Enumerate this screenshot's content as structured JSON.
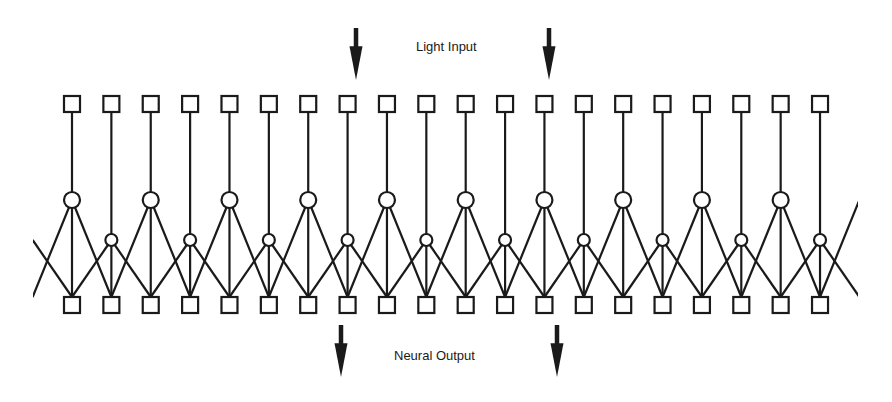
{
  "diagram": {
    "title_input": "Light Input",
    "title_output": "Neural Output",
    "colors": {
      "background": "#ffffff",
      "stroke": "#1a1a1a",
      "fill": "#ffffff"
    },
    "layout": {
      "columns": 20,
      "x_start": 72,
      "x_spacing": 39.37,
      "top_square_y": 96,
      "bottom_square_y": 297,
      "square_size": 16,
      "large_circle_y": 200,
      "large_circle_r": 8,
      "small_circle_y": 240,
      "small_circle_r": 6,
      "stroke_width": 2.2,
      "edge_clip_left": 33,
      "edge_clip_right": 858
    },
    "nodes": {
      "receptor_row": "square",
      "interneuron_row": "circle-alternating-large-small",
      "output_row": "square"
    },
    "connections": "each circle k connects to output squares k-1, k, k+1; each receptor square k connects vertically to circle k",
    "arrows": [
      {
        "id": "input-arrow-left",
        "x": 356,
        "y1": 28,
        "y2": 80,
        "direction": "down"
      },
      {
        "id": "input-arrow-right",
        "x": 549,
        "y1": 28,
        "y2": 80,
        "direction": "down"
      },
      {
        "id": "output-arrow-left",
        "x": 341,
        "y1": 325,
        "y2": 377,
        "direction": "down"
      },
      {
        "id": "output-arrow-right",
        "x": 557,
        "y1": 325,
        "y2": 377,
        "direction": "down"
      }
    ]
  }
}
